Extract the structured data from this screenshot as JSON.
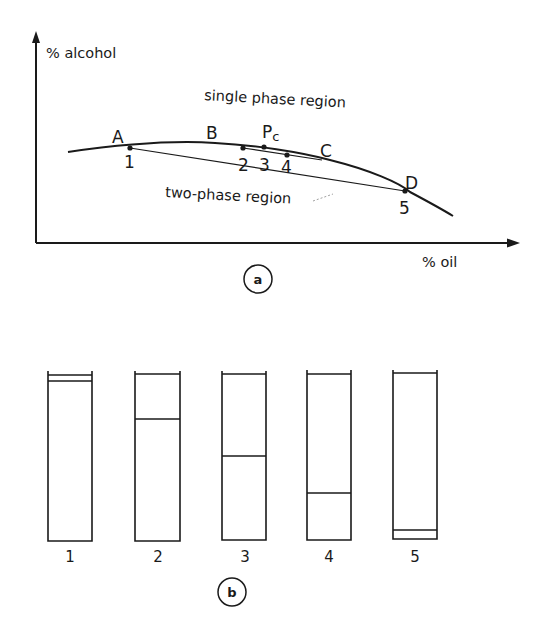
{
  "panel_a": {
    "label": "a",
    "y_axis_label": "% alcohol",
    "x_axis_label": "% oil",
    "region_upper": "single phase region",
    "region_lower": "two-phase region",
    "curve_points": {
      "A": "A",
      "B": "B",
      "Pc_main": "P",
      "Pc_sub": "c",
      "C": "C",
      "D": "D"
    },
    "tie_points": [
      "1",
      "2",
      "3",
      "4",
      "5"
    ]
  },
  "panel_b": {
    "label": "b",
    "tubes": [
      {
        "label": "1",
        "interface_fraction_from_top": 0.04
      },
      {
        "label": "2",
        "interface_fraction_from_top": 0.27
      },
      {
        "label": "3",
        "interface_fraction_from_top": 0.49
      },
      {
        "label": "4",
        "interface_fraction_from_top": 0.71
      },
      {
        "label": "5",
        "interface_fraction_from_top": 0.94
      }
    ]
  },
  "colors": {
    "ink": "#1a1a1a",
    "paper": "#ffffff"
  }
}
